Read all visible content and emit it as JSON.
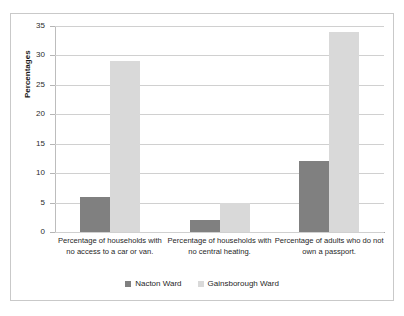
{
  "scan": {
    "top_artifact_text": " "
  },
  "chart_data": {
    "type": "bar",
    "title": "",
    "xlabel": "",
    "ylabel": "Percentages",
    "ylim": [
      0,
      35
    ],
    "ytick_values": [
      35,
      30,
      25,
      20,
      15,
      10,
      5,
      0
    ],
    "ytick_labels": [
      "35",
      "30",
      "25",
      "20",
      "15",
      "10",
      "5",
      "0"
    ],
    "grid": true,
    "legend_position": "bottom",
    "categories": [
      "Percentage of households with no access to a car or van.",
      "Percentage of households with no central heating.",
      "Percentage of adults who do not own a passport."
    ],
    "series": [
      {
        "name": "Nacton Ward",
        "color": "#808080",
        "values": [
          6,
          2,
          12
        ]
      },
      {
        "name": "Gainsborough Ward",
        "color": "#d9d9d9",
        "values": [
          29,
          5,
          34
        ]
      }
    ]
  }
}
